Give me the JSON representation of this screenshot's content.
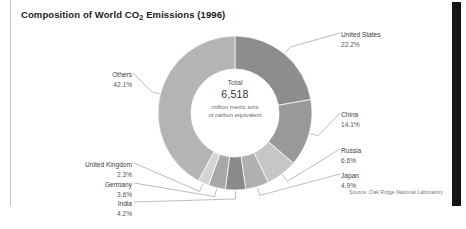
{
  "figure": {
    "title_prefix": "Composition of World CO",
    "title_sub": "2",
    "title_suffix": " Emissions (1996)",
    "title_full": "Composition of World CO2 Emissions (1996)",
    "source": "Source: Oak Ridge National Laboratory",
    "center": {
      "total_word": "Total",
      "total_value": "6,518",
      "units_line1": "million metric tons",
      "units_line2": "of carbon equivalent"
    }
  },
  "chart_data": {
    "type": "pie",
    "variant": "donut",
    "title": "Composition of World CO2 Emissions (1996)",
    "unit": "percent of world total",
    "total_value": 6518,
    "total_unit": "million metric tons of carbon equivalent",
    "source": "Oak Ridge National Laboratory",
    "year": 1996,
    "legend": "callout-labels",
    "start_angle_deg": 0,
    "direction": "clockwise",
    "categories": [
      "United States",
      "China",
      "Russia",
      "Japan",
      "India",
      "Germany",
      "United Kingdom",
      "Others"
    ],
    "values": [
      22.2,
      14.1,
      6.6,
      4.9,
      4.2,
      3.6,
      2.3,
      42.1
    ],
    "colors": [
      "#8d8d8d",
      "#999999",
      "#c6c6c6",
      "#b0b0b0",
      "#8a8a8a",
      "#a8a8a8",
      "#d4d4d4",
      "#b4b4b4"
    ],
    "slices": [
      {
        "label": "United States",
        "value": 22.2,
        "display": "22.2%",
        "color": "#8d8d8d"
      },
      {
        "label": "China",
        "value": 14.1,
        "display": "14.1%",
        "color": "#999999"
      },
      {
        "label": "Russia",
        "value": 6.6,
        "display": "6.6%",
        "color": "#c6c6c6"
      },
      {
        "label": "Japan",
        "value": 4.9,
        "display": "4.9%",
        "color": "#b0b0b0"
      },
      {
        "label": "India",
        "value": 4.2,
        "display": "4.2%",
        "color": "#8a8a8a"
      },
      {
        "label": "Germany",
        "value": 3.6,
        "display": "3.6%",
        "color": "#a8a8a8"
      },
      {
        "label": "United Kingdom",
        "value": 2.3,
        "display": "2.3%",
        "color": "#d4d4d4"
      },
      {
        "label": "Others",
        "value": 42.1,
        "display": "42.1%",
        "color": "#b4b4b4"
      }
    ]
  },
  "callouts": {
    "united_states": {
      "label": "United States",
      "pct": "22.2%"
    },
    "china": {
      "label": "China",
      "pct": "14.1%"
    },
    "russia": {
      "label": "Russia",
      "pct": "6.6%"
    },
    "japan": {
      "label": "Japan",
      "pct": "4.9%"
    },
    "india": {
      "label": "India",
      "pct": "4.2%"
    },
    "germany": {
      "label": "Germany",
      "pct": "3.6%"
    },
    "united_kingdom": {
      "label": "United Kingdom",
      "pct": "2.3%"
    },
    "others": {
      "label": "Others",
      "pct": "42.1%"
    }
  },
  "style": {
    "leader_line_color": "#8f8f8f",
    "background": "#ffffff",
    "right_bar_color": "#141414"
  }
}
